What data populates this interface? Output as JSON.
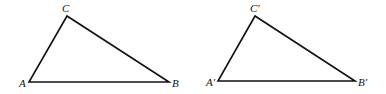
{
  "figure": {
    "width": 386,
    "height": 94,
    "stroke_color": "#111111",
    "background": "#ffffff"
  },
  "triangles": [
    {
      "name": "ABC",
      "vertices": {
        "A": {
          "label": "A",
          "x": 29,
          "y": 82,
          "label_x": 19,
          "label_y": 87
        },
        "B": {
          "label": "B",
          "x": 169,
          "y": 82,
          "label_x": 172,
          "label_y": 87
        },
        "C": {
          "label": "C",
          "x": 67,
          "y": 16,
          "label_x": 62,
          "label_y": 12
        }
      }
    },
    {
      "name": "A'B'C'",
      "vertices": {
        "A": {
          "label": "A′",
          "x": 218,
          "y": 81,
          "label_x": 206,
          "label_y": 86
        },
        "B": {
          "label": "B′",
          "x": 355,
          "y": 81,
          "label_x": 358,
          "label_y": 86
        },
        "C": {
          "label": "C′",
          "x": 255,
          "y": 16,
          "label_x": 250,
          "label_y": 12
        }
      }
    }
  ]
}
